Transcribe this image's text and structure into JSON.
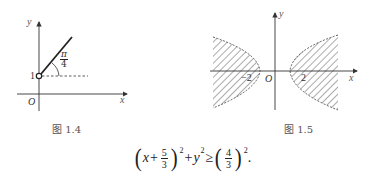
{
  "figure_1_4": {
    "caption": "图 1.4",
    "axis_x_label": "x",
    "axis_y_label": "y",
    "origin_label": "O",
    "point_label": "1",
    "angle_num": "π",
    "angle_den": "4"
  },
  "figure_1_5": {
    "caption": "图 1.5",
    "axis_x_label": "x",
    "axis_y_label": "y",
    "origin_label": "O",
    "tick_neg": "−2",
    "tick_pos": "2"
  },
  "formula": {
    "lparen1": "(",
    "x": "x",
    "plus1": "+",
    "frac1_num": "5",
    "frac1_den": "3",
    "rparen1": ")",
    "exp1": "2",
    "plus2": "+",
    "y": "y",
    "exp2": "2",
    "geq": "≥",
    "lparen2": "(",
    "frac2_num": "4",
    "frac2_den": "3",
    "rparen2": ")",
    "exp3": "2",
    "period": "."
  }
}
